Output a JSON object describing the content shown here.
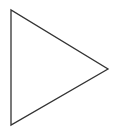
{
  "diagram": {
    "background": "#ffffff",
    "shapes": [
      {
        "type": "triangle",
        "name": "right-pointing-triangle",
        "points": [
          [
            11,
            10
          ],
          [
            11,
            125
          ],
          [
            108,
            69
          ]
        ],
        "fill": "none",
        "stroke": "#333333",
        "stroke_width": 1.3
      }
    ]
  }
}
